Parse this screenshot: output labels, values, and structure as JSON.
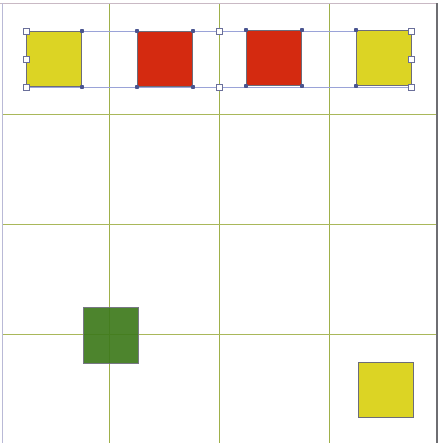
{
  "canvas": {
    "width": 441,
    "height": 443,
    "background": "#ffffff"
  },
  "grid": {
    "line_color": "#9fb04a",
    "cols": 4,
    "rows": 4,
    "vertical_lines_x": [
      109,
      219,
      329
    ],
    "horizontal_lines_y": [
      114,
      224,
      334
    ]
  },
  "colors": {
    "yellow": "#DCD424",
    "red": "#D42A10",
    "green": "#3E7A1C",
    "selection": "#9aa3d8"
  },
  "shapes": [
    {
      "id": "yellow-square-1",
      "color": "yellow",
      "x": 26,
      "y": 31,
      "w": 56,
      "h": 56,
      "selected": true
    },
    {
      "id": "red-square-1",
      "color": "red",
      "x": 137,
      "y": 31,
      "w": 56,
      "h": 56,
      "selected": true
    },
    {
      "id": "red-square-2",
      "color": "red",
      "x": 246,
      "y": 30,
      "w": 56,
      "h": 56,
      "selected": true
    },
    {
      "id": "yellow-square-2",
      "color": "yellow",
      "x": 356,
      "y": 30,
      "w": 56,
      "h": 56,
      "selected": true
    },
    {
      "id": "green-square",
      "color": "green",
      "x": 83,
      "y": 307,
      "w": 56,
      "h": 57,
      "selected": false
    },
    {
      "id": "yellow-square-3",
      "color": "yellow",
      "x": 358,
      "y": 362,
      "w": 56,
      "h": 56,
      "selected": false
    }
  ],
  "selection": {
    "x": 26,
    "y": 31,
    "w": 385,
    "h": 56,
    "handles": 8
  }
}
